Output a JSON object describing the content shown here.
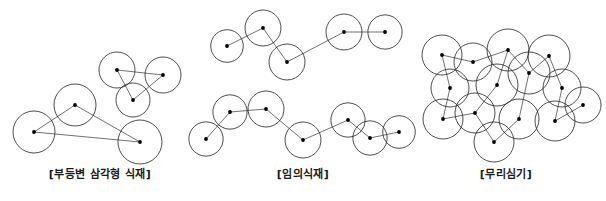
{
  "page": {
    "background_color": "#ffffff",
    "stroke_color": "#222222",
    "dot_color": "#000000",
    "line_color": "#333333",
    "width": 606,
    "height": 201
  },
  "top_cut_text": "",
  "figures": [
    {
      "id": "figure-scalene-triangle-planting",
      "caption": "[부등변 삼각형 식재]",
      "canopy_style": "smooth-circle",
      "description": "two scalene triangular groups of three trees each, centers joined by straight lines",
      "groups": [
        {
          "name": "upper-right-triangle",
          "trees": [
            {
              "cx": 117,
              "cy": 70,
              "r": 18
            },
            {
              "cx": 163,
              "cy": 75,
              "r": 18
            },
            {
              "cx": 133,
              "cy": 100,
              "r": 17
            }
          ],
          "links": [
            [
              0,
              1
            ],
            [
              1,
              2
            ],
            [
              2,
              0
            ]
          ]
        },
        {
          "name": "lower-left-triangle",
          "trees": [
            {
              "cx": 34,
              "cy": 132,
              "r": 21
            },
            {
              "cx": 75,
              "cy": 105,
              "r": 21
            },
            {
              "cx": 140,
              "cy": 142,
              "r": 22
            }
          ],
          "links": [
            [
              0,
              1
            ],
            [
              1,
              2
            ],
            [
              2,
              0
            ]
          ]
        }
      ]
    },
    {
      "id": "figure-random-planting",
      "caption": "[임의식재]",
      "canopy_style": "scalloped-canopy",
      "description": "two loose meandering rows of scalloped tree canopies joined by a zigzag polyline",
      "groups": [
        {
          "name": "upper-row",
          "trees": [
            {
              "cx": 227,
              "cy": 46,
              "r": 19
            },
            {
              "cx": 263,
              "cy": 28,
              "r": 21
            },
            {
              "cx": 287,
              "cy": 62,
              "r": 21
            },
            {
              "cx": 344,
              "cy": 32,
              "r": 21
            },
            {
              "cx": 385,
              "cy": 32,
              "r": 20
            }
          ],
          "links": [
            [
              0,
              1
            ],
            [
              1,
              2
            ],
            [
              2,
              3
            ],
            [
              3,
              4
            ]
          ]
        },
        {
          "name": "lower-row",
          "trees": [
            {
              "cx": 206,
              "cy": 139,
              "r": 20
            },
            {
              "cx": 230,
              "cy": 112,
              "r": 20
            },
            {
              "cx": 266,
              "cy": 109,
              "r": 21
            },
            {
              "cx": 303,
              "cy": 140,
              "r": 21
            },
            {
              "cx": 348,
              "cy": 120,
              "r": 20
            },
            {
              "cx": 370,
              "cy": 138,
              "r": 20
            },
            {
              "cx": 399,
              "cy": 132,
              "r": 19
            }
          ],
          "links": [
            [
              0,
              1
            ],
            [
              1,
              2
            ],
            [
              2,
              3
            ],
            [
              3,
              4
            ],
            [
              4,
              5
            ],
            [
              5,
              6
            ]
          ]
        }
      ]
    },
    {
      "id": "figure-mass-planting",
      "caption": "[무리심기]",
      "canopy_style": "smooth-circle",
      "description": "dense cluster of sixteen overlapping circular canopies linked by a continuous zigzag line",
      "groups": [
        {
          "name": "mass-cluster",
          "trees": [
            {
              "cx": 442,
              "cy": 55,
              "r": 20
            },
            {
              "cx": 473,
              "cy": 62,
              "r": 19
            },
            {
              "cx": 508,
              "cy": 50,
              "r": 21
            },
            {
              "cx": 549,
              "cy": 56,
              "r": 21
            },
            {
              "cx": 450,
              "cy": 88,
              "r": 19
            },
            {
              "cx": 497,
              "cy": 85,
              "r": 21
            },
            {
              "cx": 529,
              "cy": 73,
              "r": 21
            },
            {
              "cx": 562,
              "cy": 88,
              "r": 19
            },
            {
              "cx": 443,
              "cy": 119,
              "r": 20
            },
            {
              "cx": 475,
              "cy": 113,
              "r": 20
            },
            {
              "cx": 519,
              "cy": 119,
              "r": 20
            },
            {
              "cx": 555,
              "cy": 121,
              "r": 20
            },
            {
              "cx": 583,
              "cy": 105,
              "r": 18
            },
            {
              "cx": 494,
              "cy": 142,
              "r": 20
            }
          ],
          "links": [
            [
              0,
              1
            ],
            [
              1,
              2
            ],
            [
              2,
              5
            ],
            [
              0,
              4
            ],
            [
              4,
              8
            ],
            [
              5,
              9
            ],
            [
              9,
              13
            ],
            [
              2,
              6
            ],
            [
              6,
              10
            ],
            [
              3,
              7
            ],
            [
              7,
              11
            ],
            [
              11,
              12
            ],
            [
              3,
              6
            ],
            [
              10,
              13
            ],
            [
              9,
              8
            ]
          ]
        }
      ]
    }
  ]
}
